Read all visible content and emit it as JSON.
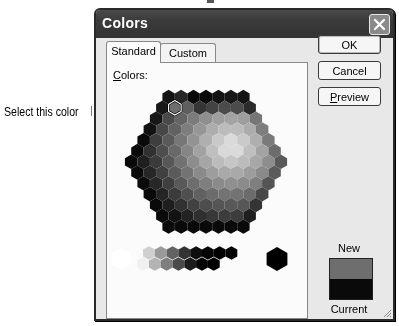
{
  "dialog": {
    "title": "Colors",
    "close_label": "Close"
  },
  "tabs": [
    {
      "label": "Standard",
      "active": true
    },
    {
      "label": "Custom",
      "active": false
    }
  ],
  "panel": {
    "colors_label_underlined": "C",
    "colors_label_rest": "olors:"
  },
  "buttons": {
    "ok": "OK",
    "cancel": "Cancel",
    "preview_underlined": "P",
    "preview_rest": "review"
  },
  "preview": {
    "new_label": "New",
    "current_label": "Current",
    "new_color": "#6e6e6e",
    "current_color": "#0a0a0a"
  },
  "callout": {
    "text": "Select this color"
  },
  "palette": {
    "selected_index": "row1-col1",
    "grays": [
      "#ffffff",
      "#f0f0f0",
      "#cfcfcf",
      "#b4b4b4",
      "#999999",
      "#7e7e7e",
      "#626262",
      "#4a4a4a",
      "#333333",
      "#1c1c1c",
      "#0d0d0d",
      "#050505",
      "#000000",
      "#000000"
    ],
    "big_black": "#000000",
    "big_white": "#ffffff"
  }
}
